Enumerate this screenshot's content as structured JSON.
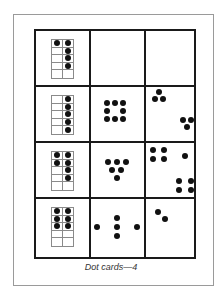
{
  "caption": "Dot cards—4",
  "colors": {
    "ink": "#111111",
    "grid_line": "#1a1a1a",
    "frame_line": "#9a9a9a",
    "tenframe_line": "#8a8a8a"
  },
  "rows": [
    {
      "ten_frame": {
        "filled": [
          true,
          true,
          false,
          true,
          false,
          true,
          false,
          true,
          false,
          false
        ],
        "count": 5
      },
      "middle_card": {
        "count": 0,
        "dots": []
      },
      "right_card": {
        "count": 0,
        "dots": []
      }
    },
    {
      "ten_frame": {
        "filled": [
          false,
          true,
          false,
          true,
          false,
          true,
          false,
          true,
          false,
          true
        ],
        "count": 5
      },
      "middle_card": {
        "count": 8,
        "dots": [
          [
            16,
            16
          ],
          [
            24,
            16
          ],
          [
            32,
            16
          ],
          [
            16,
            24
          ],
          [
            32,
            24
          ],
          [
            16,
            32
          ],
          [
            24,
            32
          ],
          [
            32,
            32
          ]
        ]
      },
      "right_card": {
        "count": 6,
        "dots": [
          [
            13,
            5
          ],
          [
            9,
            12
          ],
          [
            17,
            12
          ],
          [
            37,
            33
          ],
          [
            45,
            33
          ],
          [
            41,
            40
          ]
        ]
      }
    },
    {
      "ten_frame": {
        "filled": [
          true,
          true,
          true,
          true,
          false,
          true,
          false,
          true,
          false,
          false
        ],
        "count": 6
      },
      "middle_card": {
        "count": 6,
        "dots": [
          [
            17,
            19
          ],
          [
            26,
            19
          ],
          [
            35,
            19
          ],
          [
            21,
            27
          ],
          [
            30,
            27
          ],
          [
            26,
            35
          ]
        ]
      },
      "right_card": {
        "count": 9,
        "dots": [
          [
            7,
            7
          ],
          [
            18,
            7
          ],
          [
            7,
            16
          ],
          [
            18,
            16
          ],
          [
            39,
            13
          ],
          [
            33,
            38
          ],
          [
            45,
            38
          ],
          [
            33,
            47
          ],
          [
            45,
            47
          ]
        ]
      }
    },
    {
      "ten_frame": {
        "filled": [
          true,
          true,
          true,
          true,
          true,
          true,
          false,
          false,
          false,
          false
        ],
        "count": 6
      },
      "middle_card": {
        "count": 5,
        "dots": [
          [
            6,
            28
          ],
          [
            26,
            19
          ],
          [
            26,
            28
          ],
          [
            26,
            37
          ],
          [
            46,
            28
          ]
        ]
      },
      "right_card": {
        "count": 2,
        "dots": [
          [
            12,
            13
          ],
          [
            19,
            20
          ]
        ]
      }
    }
  ]
}
